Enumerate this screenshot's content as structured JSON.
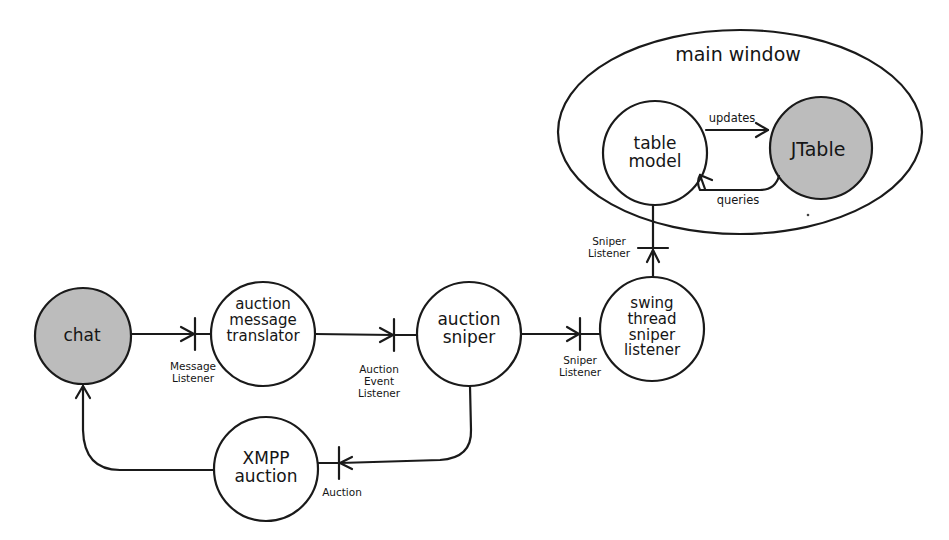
{
  "diagram": {
    "colors": {
      "stroke": "#1a1a1a",
      "shaded_fill": "#bcbcbc",
      "plain_fill": "#ffffff"
    },
    "container": {
      "label": "main window"
    },
    "nodes": {
      "chat": {
        "label": "chat",
        "shaded": true
      },
      "translator": {
        "label": "auction\nmessage\ntranslator"
      },
      "sniper": {
        "label": "auction\nsniper"
      },
      "swing": {
        "label": "swing\nthread\nsniper\nlistener"
      },
      "xmpp": {
        "label": "XMPP\nauction"
      },
      "table_model": {
        "label": "table\nmodel"
      },
      "jtable": {
        "label": "JTable",
        "shaded": true
      }
    },
    "interfaces": {
      "message_listener": "Message\nListener",
      "auction_event_listener": "Auction\nEvent\nListener",
      "sniper_listener_1": "Sniper\nListener",
      "sniper_listener_2": "Sniper\nListener",
      "auction": "Auction"
    },
    "edges": {
      "updates": "updates",
      "queries": "queries"
    }
  }
}
